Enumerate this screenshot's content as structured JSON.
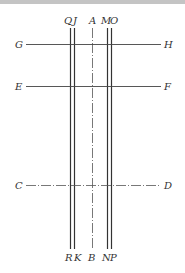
{
  "diagram": {
    "top_labels": [
      "Q",
      "J",
      "A",
      "M",
      "O"
    ],
    "bottom_labels": [
      "R",
      "K",
      "B",
      "N",
      "P"
    ],
    "horizontal_lines": [
      {
        "left": "G",
        "right": "H",
        "style": "solid"
      },
      {
        "left": "E",
        "right": "F",
        "style": "solid"
      },
      {
        "left": "C",
        "right": "D",
        "style": "dash-dot"
      }
    ],
    "vertical_lines": [
      {
        "top": "Q",
        "bottom": "R",
        "style": "solid"
      },
      {
        "top": "J",
        "bottom": "K",
        "style": "solid"
      },
      {
        "top": "A",
        "bottom": "B",
        "style": "dash-dot"
      },
      {
        "top": "M",
        "bottom": "N",
        "style": "solid"
      },
      {
        "top": "O",
        "bottom": "P",
        "style": "solid"
      }
    ],
    "line_color": "#333333"
  }
}
